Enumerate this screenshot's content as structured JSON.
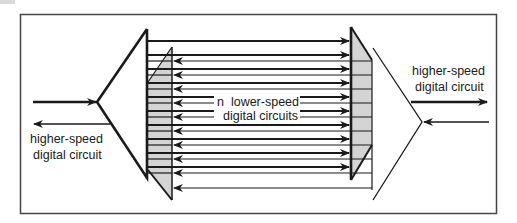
{
  "labels": {
    "left_line1": "higher-speed",
    "left_line2": "digital circuit",
    "right_line1": "higher-speed",
    "right_line2": "digital circuit",
    "center_line1": "n  lower-speed",
    "center_line2": "digital circuits"
  },
  "colors": {
    "stroke": "#1a1a1a",
    "frame": "#444444",
    "shade": "#d4d4d4",
    "background": "#ffffff"
  },
  "diagram": {
    "frame": {
      "x": 20,
      "y": 14,
      "w": 476,
      "h": 199
    },
    "channel_count": 10,
    "forward_channels_y": [
      41,
      55,
      69,
      83,
      97,
      111,
      125,
      139,
      153,
      167
    ],
    "return_channels_y": [
      61,
      75,
      89,
      103,
      117,
      131,
      145,
      159,
      173,
      188
    ],
    "elements": [
      "left-multiplexer-triangle",
      "left-demultiplexer-trapezoid",
      "right-demultiplexer-trapezoid",
      "right-multiplexer-triangle"
    ]
  }
}
